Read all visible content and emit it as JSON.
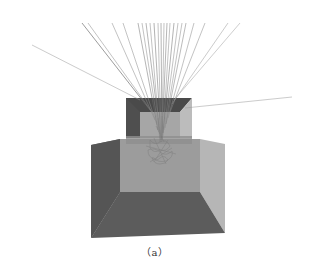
{
  "figure": {
    "caption": "（a）",
    "colors": {
      "background": "#ffffff",
      "outer_box_dark": "#555555",
      "outer_box_back": "#9a9a9a",
      "outer_box_right": "#b4b4b4",
      "outer_box_floor": "#5a5a5a",
      "inner_box_dark": "#4e4e4e",
      "inner_box_back": "#a8a8a8",
      "inner_box_right": "#b8b8b8",
      "track": "#8a8a8a",
      "track_dark": "#6a6a6a",
      "scatter_cloud": "#7a7a7a"
    },
    "focus_point": [
      160,
      140
    ]
  }
}
